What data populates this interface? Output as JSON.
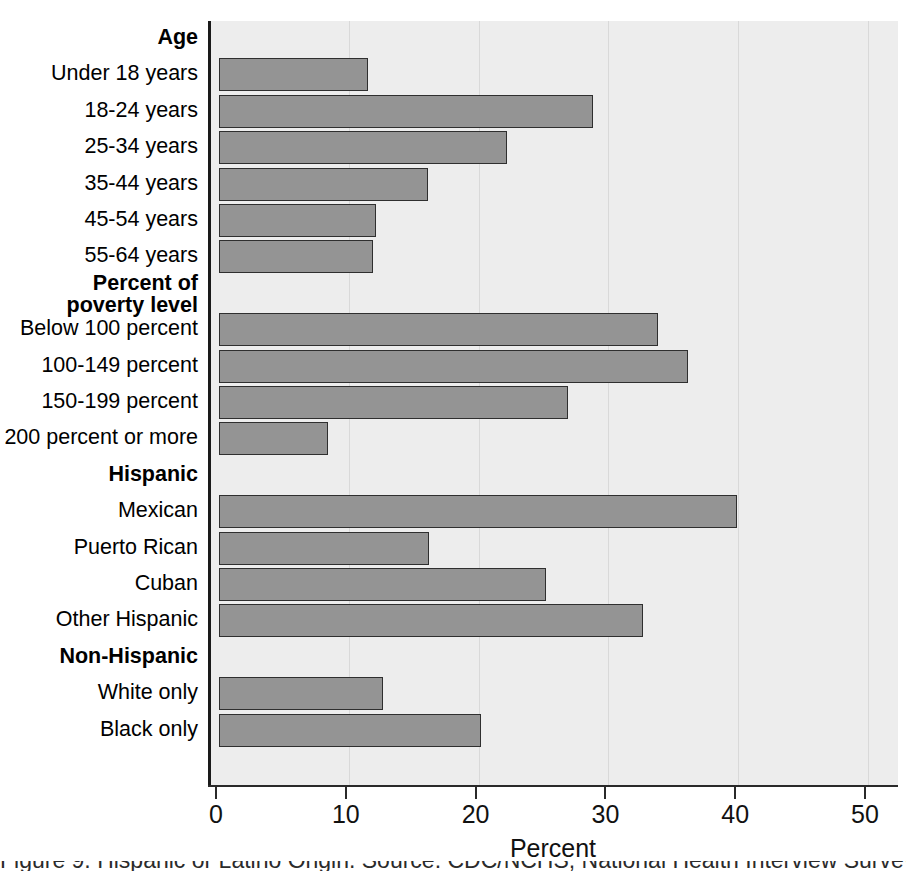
{
  "chart_data": {
    "type": "bar",
    "orientation": "horizontal",
    "title": "",
    "xlabel": "Percent",
    "ylabel": "",
    "xlim": [
      0,
      50
    ],
    "xticks": [
      0,
      10,
      20,
      30,
      40,
      50
    ],
    "xtick_labels": [
      "0",
      "10",
      "20",
      "30",
      "40",
      "50"
    ],
    "grid": "vertical",
    "legend": "none",
    "bar_color": "#949494",
    "bar_edge_color": "#2f2f2f",
    "plot_background": "#ededed",
    "rows": [
      {
        "kind": "group",
        "label": "Age",
        "value": null
      },
      {
        "kind": "bar",
        "label": "Under 18 years",
        "value": 11.5
      },
      {
        "kind": "bar",
        "label": "18-24 years",
        "value": 28.8
      },
      {
        "kind": "bar",
        "label": "25-34 years",
        "value": 22.2
      },
      {
        "kind": "bar",
        "label": "35-44 years",
        "value": 16.1
      },
      {
        "kind": "bar",
        "label": "45-54 years",
        "value": 12.1
      },
      {
        "kind": "bar",
        "label": "55-64 years",
        "value": 11.9
      },
      {
        "kind": "group2",
        "label": "Percent of poverty level",
        "label_line1": "Percent of",
        "label_line2": "poverty level",
        "value": null
      },
      {
        "kind": "bar",
        "label": "Below 100 percent",
        "value": 33.8
      },
      {
        "kind": "bar",
        "label": "100-149 percent",
        "value": 36.1
      },
      {
        "kind": "bar",
        "label": "150-199 percent",
        "value": 26.9
      },
      {
        "kind": "bar",
        "label": "200 percent or more",
        "value": 8.4
      },
      {
        "kind": "group",
        "label": "Hispanic",
        "value": null
      },
      {
        "kind": "bar",
        "label": "Mexican",
        "value": 39.9
      },
      {
        "kind": "bar",
        "label": "Puerto Rican",
        "value": 16.2
      },
      {
        "kind": "bar",
        "label": "Cuban",
        "value": 25.2
      },
      {
        "kind": "bar",
        "label": "Other Hispanic",
        "value": 32.7
      },
      {
        "kind": "group",
        "label": "Non-Hispanic",
        "value": null
      },
      {
        "kind": "bar",
        "label": "White only",
        "value": 12.6
      },
      {
        "kind": "bar",
        "label": "Black only",
        "value": 20.2
      }
    ],
    "categories": [
      "Under 18 years",
      "18-24 years",
      "25-34 years",
      "35-44 years",
      "45-54 years",
      "55-64 years",
      "Below 100 percent",
      "100-149 percent",
      "150-199 percent",
      "200 percent or more",
      "Mexican",
      "Puerto Rican",
      "Cuban",
      "Other Hispanic",
      "White only",
      "Black only"
    ],
    "values": [
      11.5,
      28.8,
      22.2,
      16.1,
      12.1,
      11.9,
      33.8,
      36.1,
      26.9,
      8.4,
      39.9,
      16.2,
      25.2,
      32.7,
      12.6,
      20.2
    ],
    "group_headers": [
      "Age",
      "Percent of poverty level",
      "Hispanic",
      "Non-Hispanic"
    ]
  },
  "caption": {
    "partial_text": "Figure 9. Hispanic or Latino Origin. Source: CDC/NCHS, National Health Interview Survey."
  }
}
